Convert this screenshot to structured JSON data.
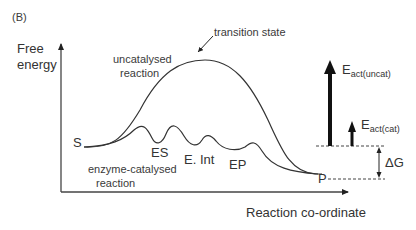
{
  "panel_label": "(B)",
  "axes": {
    "y_label_line1": "Free",
    "y_label_line2": "energy",
    "x_label": "Reaction co-ordinate"
  },
  "curves": {
    "uncatalysed_line1": "uncatalysed",
    "uncatalysed_line2": "reaction",
    "catalysed_line1": "enzyme-catalysed",
    "catalysed_line2": "reaction"
  },
  "annotations": {
    "transition_state": "transition state",
    "substrate": "S",
    "product": "P",
    "enzyme_substrate": "ES",
    "enzyme_intermediate": "E. Int",
    "enzyme_product": "EP",
    "delta_g": "ΔG",
    "e_act_uncat_main": "E",
    "e_act_uncat_sub": "act(uncat)",
    "e_act_cat_main": "E",
    "e_act_cat_sub": "act(cat)"
  }
}
